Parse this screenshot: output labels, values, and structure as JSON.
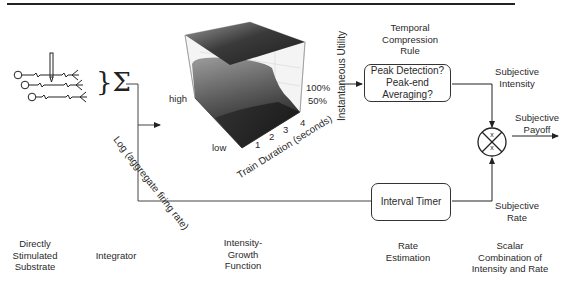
{
  "diagram": {
    "top_rule": true,
    "stages": [
      {
        "id": "substrate",
        "label_lines": [
          "Directly",
          "Stimulated",
          "Substrate"
        ]
      },
      {
        "id": "integrator",
        "label_lines": [
          "Integrator"
        ]
      },
      {
        "id": "growth",
        "label_lines": [
          "Intensity-",
          "Growth",
          "Function"
        ]
      },
      {
        "id": "rate",
        "label_lines": [
          "Rate",
          "Estimation"
        ]
      },
      {
        "id": "combination",
        "label_lines": [
          "Scalar",
          "Combination of",
          "Intensity and Rate"
        ]
      }
    ],
    "integrator_symbol": "}Σ",
    "plot3d": {
      "y_axis_label": "Log (aggregate firing rate)",
      "y_ticks": [
        "high",
        "low"
      ],
      "x_axis_label": "Train Duration (seconds)",
      "x_ticks": [
        "1",
        "2",
        "3",
        "4"
      ],
      "z_axis_label": "Instantaneous Utility",
      "z_ticks": [
        "100%",
        "50%"
      ]
    },
    "temporal_rule": {
      "title_lines": [
        "Temporal",
        "Compression",
        "Rule"
      ],
      "box_lines": [
        "Peak Detection?",
        "Peak-end",
        "Averaging?"
      ]
    },
    "interval_timer": {
      "label": "Interval Timer"
    },
    "subjective_intensity": {
      "label_lines": [
        "Subjective",
        "Intensity"
      ]
    },
    "subjective_rate": {
      "label_lines": [
        "Subjective",
        "Rate"
      ]
    },
    "subjective_payoff": {
      "label_lines": [
        "Subjective",
        "Payoff"
      ]
    },
    "multiplier": {
      "symbol_top": "x",
      "symbol_bottom": "x"
    }
  }
}
